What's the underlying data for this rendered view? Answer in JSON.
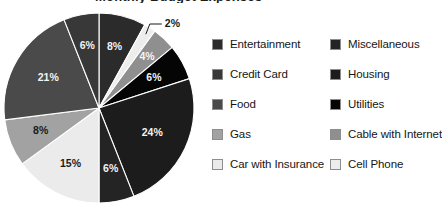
{
  "title_fragment": "Monthly Budget Expenses",
  "chart_data": {
    "type": "pie",
    "title": "Monthly Budget Expenses",
    "xlabel": "",
    "ylabel": "",
    "legend_position": "right",
    "grid": false,
    "units": "percent",
    "total": 100,
    "start_angle_deg": 0,
    "direction": "clockwise",
    "categories": [
      "Entertainment",
      "Cell Phone",
      "Cable with Internet",
      "Utilities",
      "Housing",
      "Miscellaneous",
      "Car with Insurance",
      "Gas",
      "Food",
      "Credit Card"
    ],
    "values": [
      8,
      2,
      4,
      6,
      24,
      6,
      15,
      8,
      21,
      6
    ],
    "labels": [
      "8%",
      "2%",
      "4%",
      "6%",
      "24%",
      "6%",
      "15%",
      "8%",
      "21%",
      "6%"
    ],
    "colors": [
      "#2b2b2b",
      "#ededed",
      "#8f8f8f",
      "#050505",
      "#1c1c1c",
      "#242424",
      "#ebebeb",
      "#a2a2a2",
      "#4a4a4a",
      "#383838"
    ],
    "slices": [
      {
        "label": "Entertainment",
        "value": 8,
        "display": "8%",
        "color": "#2b2b2b",
        "label_color": "#f2f2f2",
        "callout": false
      },
      {
        "label": "Cell Phone",
        "value": 2,
        "display": "2%",
        "color": "#ededed",
        "label_color": "#1b1b1b",
        "callout": true
      },
      {
        "label": "Cable with Internet",
        "value": 4,
        "display": "4%",
        "color": "#8f8f8f",
        "label_color": "#f5f5f5",
        "callout": false
      },
      {
        "label": "Utilities",
        "value": 6,
        "display": "6%",
        "color": "#050505",
        "label_color": "#f2f2f2",
        "callout": false
      },
      {
        "label": "Housing",
        "value": 24,
        "display": "24%",
        "color": "#1c1c1c",
        "label_color": "#f2f2f2",
        "callout": false
      },
      {
        "label": "Miscellaneous",
        "value": 6,
        "display": "6%",
        "color": "#242424",
        "label_color": "#f2f2f2",
        "callout": false
      },
      {
        "label": "Car with Insurance",
        "value": 15,
        "display": "15%",
        "color": "#ebebeb",
        "label_color": "#1b1b1b",
        "callout": false
      },
      {
        "label": "Gas",
        "value": 8,
        "display": "8%",
        "color": "#a2a2a2",
        "label_color": "#1b1b1b",
        "callout": false
      },
      {
        "label": "Food",
        "value": 21,
        "display": "21%",
        "color": "#4a4a4a",
        "label_color": "#f2f2f2",
        "callout": false
      },
      {
        "label": "Credit Card",
        "value": 6,
        "display": "6%",
        "color": "#383838",
        "label_color": "#f2f2f2",
        "callout": false
      }
    ],
    "callout": {
      "label": "2%",
      "for_category": "Cell Phone"
    }
  },
  "legend": {
    "columns": 2,
    "entries": [
      {
        "label": "Entertainment",
        "color": "#2b2b2b"
      },
      {
        "label": "Miscellaneous",
        "color": "#242424"
      },
      {
        "label": "Credit Card",
        "color": "#383838"
      },
      {
        "label": "Housing",
        "color": "#1c1c1c"
      },
      {
        "label": "Food",
        "color": "#4a4a4a"
      },
      {
        "label": "Utilities",
        "color": "#050505"
      },
      {
        "label": "Gas",
        "color": "#a2a2a2"
      },
      {
        "label": "Cable with Internet",
        "color": "#8f8f8f"
      },
      {
        "label": "Car with Insurance",
        "color": "#ebebeb"
      },
      {
        "label": "Cell Phone",
        "color": "#ededed"
      }
    ]
  }
}
